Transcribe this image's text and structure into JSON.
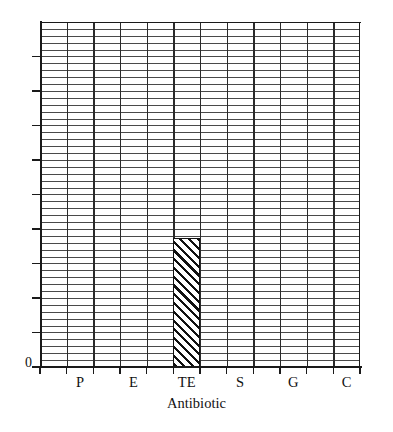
{
  "chart_data": {
    "type": "bar",
    "title": "",
    "subtitle": "",
    "xlabel": "Antibiotic",
    "ylabel": "",
    "categories": [
      "P",
      "E",
      "TE",
      "S",
      "G",
      "C"
    ],
    "values": [
      0,
      0,
      3.7,
      0,
      0,
      0
    ],
    "ylim": [
      0,
      9.9
    ],
    "y_tick_labels": [
      "0"
    ],
    "y_major_tick_count": 10,
    "y_minor_gridlines_per_major": 5,
    "x_major_gridline_count": 11,
    "grid": "on",
    "legend": "none",
    "annotations": [],
    "series": [
      {
        "name": "Zone of inhibition",
        "fill": "diagonal-hatch",
        "values": [
          0,
          0,
          3.7,
          0,
          0,
          0
        ]
      }
    ]
  },
  "axes": {
    "y_zero_label": "0",
    "x_title": "Antibiotic",
    "x_tick_labels": [
      "P",
      "E",
      "TE",
      "S",
      "G",
      "C"
    ]
  },
  "colors": {
    "ink": "#111111",
    "grid_minor": "#4a4a4a",
    "grid_major": "#2b2b2b",
    "background": "#ffffff",
    "bar_hatch": "#111111"
  }
}
